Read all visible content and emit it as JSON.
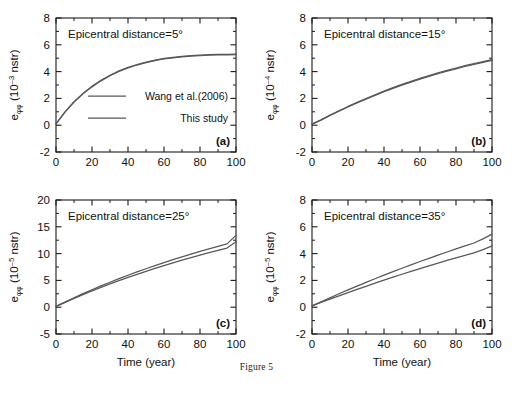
{
  "figure": {
    "caption": "Figure 5",
    "axis_color": "#1a1a1a",
    "curve_color": "#585858"
  },
  "legend": {
    "items": [
      {
        "label": "Wang et al.(2006)"
      },
      {
        "label": "This study"
      }
    ]
  },
  "chart_data": [
    {
      "type": "line",
      "panel": "a",
      "letter": "(a)",
      "title": "Epicentral distance=5°",
      "xlabel": "",
      "ylabel_base": "e",
      "ylabel_sub": "φφ",
      "ylabel_unit_pre": " (10",
      "ylabel_exp": "–3",
      "ylabel_unit_post": " nstr)",
      "xlim": [
        0,
        100
      ],
      "ylim": [
        -2,
        8
      ],
      "xticks": [
        0,
        20,
        40,
        60,
        80,
        100
      ],
      "yticks": [
        -2,
        0,
        2,
        4,
        6,
        8
      ],
      "xminor": 10,
      "yminor": 1,
      "grid": false,
      "legend_position": "center",
      "x": [
        0,
        5,
        10,
        15,
        20,
        25,
        30,
        35,
        40,
        45,
        50,
        55,
        60,
        65,
        70,
        75,
        80,
        85,
        90,
        95,
        100
      ],
      "series": [
        {
          "name": "Wang et al.(2006)",
          "values": [
            0.1,
            1.0,
            1.75,
            2.37,
            2.9,
            3.35,
            3.73,
            4.05,
            4.31,
            4.53,
            4.71,
            4.86,
            4.98,
            5.07,
            5.14,
            5.19,
            5.23,
            5.26,
            5.28,
            5.29,
            5.3
          ]
        },
        {
          "name": "This study",
          "values": [
            0.1,
            0.98,
            1.72,
            2.34,
            2.86,
            3.31,
            3.69,
            4.01,
            4.27,
            4.49,
            4.67,
            4.82,
            4.94,
            5.03,
            5.1,
            5.15,
            5.19,
            5.22,
            5.24,
            5.25,
            5.26
          ]
        }
      ]
    },
    {
      "type": "line",
      "panel": "b",
      "letter": "(b)",
      "title": "Epicentral distance=15°",
      "xlabel": "",
      "ylabel_base": "e",
      "ylabel_sub": "φφ",
      "ylabel_unit_pre": " (10",
      "ylabel_exp": "–4",
      "ylabel_unit_post": " nstr)",
      "xlim": [
        0,
        100
      ],
      "ylim": [
        -2,
        8
      ],
      "xticks": [
        0,
        20,
        40,
        60,
        80,
        100
      ],
      "yticks": [
        -2,
        0,
        2,
        4,
        6,
        8
      ],
      "xminor": 10,
      "yminor": 1,
      "grid": false,
      "legend_position": "none",
      "x": [
        0,
        5,
        10,
        15,
        20,
        25,
        30,
        35,
        40,
        45,
        50,
        55,
        60,
        65,
        70,
        75,
        80,
        85,
        90,
        95,
        100
      ],
      "series": [
        {
          "name": "Wang et al.(2006)",
          "values": [
            0.08,
            0.4,
            0.75,
            1.08,
            1.4,
            1.7,
            1.99,
            2.27,
            2.54,
            2.8,
            3.04,
            3.27,
            3.49,
            3.7,
            3.9,
            4.09,
            4.27,
            4.44,
            4.6,
            4.75,
            4.9
          ]
        },
        {
          "name": "This study",
          "values": [
            0.08,
            0.38,
            0.72,
            1.05,
            1.36,
            1.66,
            1.95,
            2.23,
            2.5,
            2.75,
            2.99,
            3.22,
            3.44,
            3.64,
            3.84,
            4.03,
            4.21,
            4.38,
            4.54,
            4.69,
            4.83
          ]
        }
      ]
    },
    {
      "type": "line",
      "panel": "c",
      "letter": "(c)",
      "title": "Epicentral distance=25°",
      "xlabel": "Time (year)",
      "ylabel_base": "e",
      "ylabel_sub": "φφ",
      "ylabel_unit_pre": " (10",
      "ylabel_exp": "–5",
      "ylabel_unit_post": " nstr)",
      "xlim": [
        0,
        100
      ],
      "ylim": [
        -5,
        20
      ],
      "xticks": [
        0,
        20,
        40,
        60,
        80,
        100
      ],
      "yticks": [
        -5,
        0,
        5,
        10,
        15,
        20
      ],
      "xminor": 10,
      "yminor": 2.5,
      "grid": false,
      "legend_position": "none",
      "x": [
        0,
        5,
        10,
        15,
        20,
        25,
        30,
        35,
        40,
        45,
        50,
        55,
        60,
        65,
        70,
        75,
        80,
        85,
        90,
        95,
        100
      ],
      "series": [
        {
          "name": "Wang et al.(2006)",
          "values": [
            0.15,
            0.95,
            1.75,
            2.52,
            3.26,
            3.97,
            4.66,
            5.32,
            5.96,
            6.58,
            7.18,
            7.76,
            8.32,
            8.86,
            9.39,
            9.9,
            10.4,
            10.88,
            11.35,
            11.81,
            13.4
          ]
        },
        {
          "name": "This study",
          "values": [
            0.15,
            0.9,
            1.64,
            2.35,
            3.04,
            3.7,
            4.34,
            4.96,
            5.56,
            6.14,
            6.7,
            7.24,
            7.77,
            8.28,
            8.77,
            9.25,
            9.72,
            10.17,
            10.61,
            11.04,
            12.2
          ]
        }
      ]
    },
    {
      "type": "line",
      "panel": "d",
      "letter": "(d)",
      "title": "Epicentral distance=35°",
      "xlabel": "Time (year)",
      "ylabel_base": "e",
      "ylabel_sub": "φφ",
      "ylabel_unit_pre": " (10",
      "ylabel_exp": "–5",
      "ylabel_unit_post": " nstr)",
      "xlim": [
        0,
        100
      ],
      "ylim": [
        -2,
        8
      ],
      "xticks": [
        0,
        20,
        40,
        60,
        80,
        100
      ],
      "yticks": [
        -2,
        0,
        2,
        4,
        6,
        8
      ],
      "xminor": 10,
      "yminor": 1,
      "grid": false,
      "legend_position": "none",
      "x": [
        0,
        5,
        10,
        15,
        20,
        25,
        30,
        35,
        40,
        45,
        50,
        55,
        60,
        65,
        70,
        75,
        80,
        85,
        90,
        95,
        100
      ],
      "series": [
        {
          "name": "Wang et al.(2006)",
          "values": [
            0.1,
            0.4,
            0.7,
            1.0,
            1.29,
            1.57,
            1.85,
            2.12,
            2.39,
            2.65,
            2.91,
            3.16,
            3.41,
            3.65,
            3.89,
            4.12,
            4.35,
            4.57,
            4.79,
            5.1,
            5.45
          ]
        },
        {
          "name": "This study",
          "values": [
            0.1,
            0.35,
            0.6,
            0.85,
            1.09,
            1.33,
            1.56,
            1.79,
            2.02,
            2.24,
            2.46,
            2.67,
            2.88,
            3.09,
            3.29,
            3.49,
            3.68,
            3.87,
            4.06,
            4.3,
            4.58
          ]
        }
      ]
    }
  ]
}
